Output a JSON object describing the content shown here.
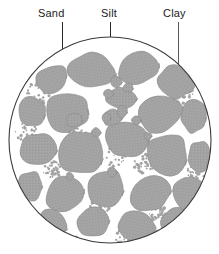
{
  "labels": [
    {
      "id": "sand",
      "text": "Sand"
    },
    {
      "id": "silt",
      "text": "Silt"
    },
    {
      "id": "clay",
      "text": "Clay"
    }
  ],
  "colors": {
    "grain_fill": "#a3a3a3",
    "grain_stroke": "#8c8c8c",
    "pore_space": "#ffffff",
    "circle_outline": "#3a3a3a",
    "leader_line": "#2b2b2b",
    "leader_line_light": "#5a5a5a",
    "label_text": "#1a1a1a",
    "background": "#ffffff"
  },
  "circle": {
    "center_x": 102,
    "center_y": 104,
    "radius_x": 101,
    "radius_y": 103
  },
  "sand_grains": [
    {
      "cx": 44,
      "cy": 44,
      "rx": 18,
      "ry": 15,
      "rot": -20
    },
    {
      "cx": 84,
      "cy": 34,
      "rx": 24,
      "ry": 17,
      "rot": 8
    },
    {
      "cx": 130,
      "cy": 32,
      "rx": 21,
      "ry": 16,
      "rot": -12
    },
    {
      "cx": 167,
      "cy": 46,
      "rx": 20,
      "ry": 16,
      "rot": 25
    },
    {
      "cx": 24,
      "cy": 76,
      "rx": 14,
      "ry": 17,
      "rot": 10
    },
    {
      "cx": 60,
      "cy": 76,
      "rx": 24,
      "ry": 20,
      "rot": -8
    },
    {
      "cx": 113,
      "cy": 62,
      "rx": 15,
      "ry": 12,
      "rot": 0
    },
    {
      "cx": 152,
      "cy": 78,
      "rx": 24,
      "ry": 18,
      "rot": -18
    },
    {
      "cx": 186,
      "cy": 80,
      "rx": 14,
      "ry": 18,
      "rot": 5
    },
    {
      "cx": 30,
      "cy": 114,
      "rx": 18,
      "ry": 18,
      "rot": 0
    },
    {
      "cx": 74,
      "cy": 118,
      "rx": 22,
      "ry": 24,
      "rot": 12
    },
    {
      "cx": 118,
      "cy": 104,
      "rx": 22,
      "ry": 20,
      "rot": -6
    },
    {
      "cx": 160,
      "cy": 118,
      "rx": 22,
      "ry": 22,
      "rot": 16
    },
    {
      "cx": 192,
      "cy": 120,
      "rx": 12,
      "ry": 16,
      "rot": 0
    },
    {
      "cx": 22,
      "cy": 150,
      "rx": 15,
      "ry": 15,
      "rot": 0
    },
    {
      "cx": 56,
      "cy": 158,
      "rx": 20,
      "ry": 17,
      "rot": -14
    },
    {
      "cx": 98,
      "cy": 152,
      "rx": 18,
      "ry": 20,
      "rot": 8
    },
    {
      "cx": 142,
      "cy": 158,
      "rx": 21,
      "ry": 19,
      "rot": -10
    },
    {
      "cx": 180,
      "cy": 156,
      "rx": 16,
      "ry": 18,
      "rot": 6
    },
    {
      "cx": 44,
      "cy": 188,
      "rx": 17,
      "ry": 14,
      "rot": 18
    },
    {
      "cx": 86,
      "cy": 186,
      "rx": 19,
      "ry": 15,
      "rot": -6
    },
    {
      "cx": 128,
      "cy": 190,
      "rx": 20,
      "ry": 15,
      "rot": 10
    },
    {
      "cx": 168,
      "cy": 186,
      "rx": 16,
      "ry": 14,
      "rot": -8
    },
    {
      "cx": 66,
      "cy": 84,
      "rx": 9,
      "ry": 8,
      "rot": 0
    },
    {
      "cx": 104,
      "cy": 82,
      "rx": 10,
      "ry": 9,
      "rot": 0
    }
  ],
  "silt_particles": [
    {
      "cx": 108,
      "cy": 46,
      "r": 6
    },
    {
      "cx": 120,
      "cy": 52,
      "r": 5
    },
    {
      "cx": 100,
      "cy": 58,
      "r": 5
    },
    {
      "cx": 114,
      "cy": 76,
      "r": 6
    },
    {
      "cx": 98,
      "cy": 82,
      "r": 5
    },
    {
      "cx": 128,
      "cy": 84,
      "r": 5
    },
    {
      "cx": 88,
      "cy": 96,
      "r": 5
    },
    {
      "cx": 140,
      "cy": 100,
      "r": 4
    },
    {
      "cx": 104,
      "cy": 136,
      "r": 5
    },
    {
      "cx": 62,
      "cy": 140,
      "r": 4
    }
  ],
  "clay_clusters": [
    {
      "cx": 30,
      "cy": 58,
      "r": 12
    },
    {
      "cx": 18,
      "cy": 96,
      "r": 11
    },
    {
      "cx": 70,
      "cy": 96,
      "r": 10
    },
    {
      "cx": 108,
      "cy": 120,
      "r": 11
    },
    {
      "cx": 136,
      "cy": 128,
      "r": 10
    },
    {
      "cx": 176,
      "cy": 60,
      "r": 10
    },
    {
      "cx": 186,
      "cy": 140,
      "r": 11
    },
    {
      "cx": 44,
      "cy": 134,
      "r": 9
    },
    {
      "cx": 92,
      "cy": 170,
      "r": 10
    },
    {
      "cx": 150,
      "cy": 176,
      "r": 10
    },
    {
      "cx": 116,
      "cy": 202,
      "r": 9
    },
    {
      "cx": 62,
      "cy": 206,
      "r": 9
    }
  ]
}
